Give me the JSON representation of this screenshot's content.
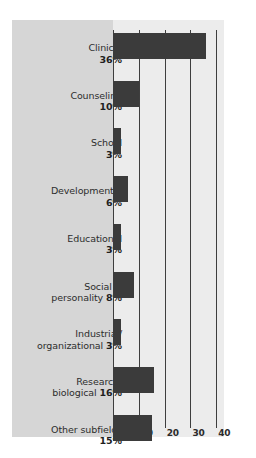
{
  "chart_data": {
    "type": "bar",
    "orientation": "horizontal",
    "title": "",
    "subtitle": "",
    "xlabel": "",
    "ylabel": "",
    "xlim": [
      0,
      43
    ],
    "xticks": [
      "0",
      "10",
      "20",
      "30",
      "40"
    ],
    "xtick_values": [
      0,
      10,
      20,
      30,
      40
    ],
    "grid": true,
    "legend": false,
    "categories": [
      "Clinical",
      "Counseling",
      "School",
      "Developmental",
      "Educational",
      "Social & personality",
      "Industrial/ organizational",
      "Research, biological",
      "Other subfields"
    ],
    "values": [
      36,
      10,
      3,
      6,
      3,
      8,
      3,
      16,
      15
    ],
    "value_labels": [
      "36%",
      "10%",
      "3%",
      "6%",
      "3%",
      "8%",
      "3%",
      "16%",
      "15%"
    ],
    "colors": {
      "bar": "#3b3b3b",
      "panel": "#d6d6d6",
      "plot_area": "#ececec",
      "gridline": "#3e3e3e",
      "text": "#2d2d2d",
      "background": "#ffffff"
    }
  },
  "labels": [
    {
      "line1": "Clinical",
      "line2": "36%",
      "pct_on_line2": true,
      "value": 36
    },
    {
      "line1": "Counseling",
      "line2": "10%",
      "pct_on_line2": true,
      "value": 10
    },
    {
      "line1": "School",
      "line2": "3%",
      "pct_on_line2": true,
      "value": 3
    },
    {
      "line1": "Developmental",
      "line2": "6%",
      "pct_on_line2": true,
      "value": 6
    },
    {
      "line1": "Educational",
      "line2": "3%",
      "pct_on_line2": true,
      "value": 3
    },
    {
      "line1": "Social &",
      "line2": "personality ",
      "pct": "8%",
      "value": 8
    },
    {
      "line1": "Industrial/",
      "line2": "organizational ",
      "pct": "3%",
      "value": 3
    },
    {
      "line1": "Research,",
      "line2": "biological ",
      "pct": "16%",
      "value": 16
    },
    {
      "line1": "Other subfields",
      "line2": "15%",
      "pct_on_line2": true,
      "value": 15
    }
  ],
  "axis": {
    "ticks": [
      {
        "label": "0",
        "value": 0
      },
      {
        "label": "10",
        "value": 10
      },
      {
        "label": "20",
        "value": 20
      },
      {
        "label": "30",
        "value": 30
      },
      {
        "label": "40",
        "value": 40
      }
    ]
  }
}
